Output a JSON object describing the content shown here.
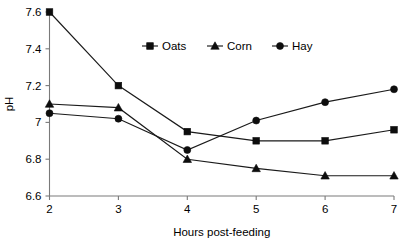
{
  "chart_data": {
    "type": "line",
    "title": "",
    "subtitle": "",
    "xlabel": "Hours post-feeding",
    "ylabel": "pH",
    "x": [
      2,
      3,
      4,
      5,
      6,
      7
    ],
    "xticklabels": [
      "2",
      "3",
      "4",
      "5",
      "6",
      "7"
    ],
    "xlim": [
      2,
      7
    ],
    "ylim": [
      6.6,
      7.6
    ],
    "yticks": [
      6.6,
      6.8,
      7.0,
      7.2,
      7.4,
      7.6
    ],
    "yticklabels": [
      "6.6",
      "6.8",
      "7",
      "7.2",
      "7.4",
      "7.6"
    ],
    "grid": false,
    "legend_position": "top-center",
    "series": [
      {
        "name": "Oats",
        "marker": "square",
        "color": "#0d0d0d",
        "values": [
          7.6,
          7.2,
          6.95,
          6.9,
          6.9,
          6.96
        ]
      },
      {
        "name": "Corn",
        "marker": "triangle",
        "color": "#0d0d0d",
        "values": [
          7.1,
          7.08,
          6.8,
          6.75,
          6.71,
          6.71
        ]
      },
      {
        "name": "Hay",
        "marker": "circle",
        "color": "#0d0d0d",
        "values": [
          7.05,
          7.02,
          6.85,
          7.01,
          7.11,
          7.18
        ]
      }
    ]
  },
  "axes": {
    "y_title": "pH",
    "x_title": "Hours post-feeding"
  },
  "legend": {
    "entries": [
      {
        "label": "Oats",
        "marker": "square"
      },
      {
        "label": "Corn",
        "marker": "triangle"
      },
      {
        "label": "Hay",
        "marker": "circle"
      }
    ]
  },
  "colors": {
    "axis": "#7a7a7a",
    "series": "#0d0d0d",
    "background": "#ffffff"
  }
}
